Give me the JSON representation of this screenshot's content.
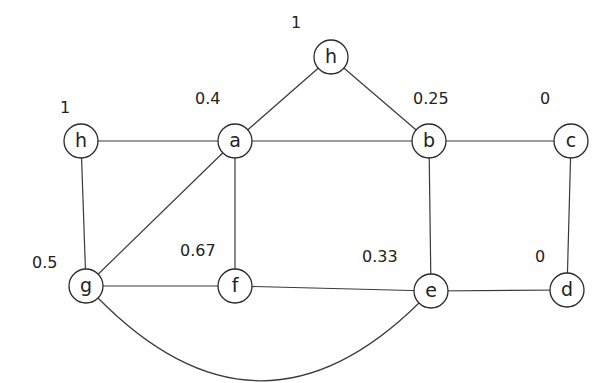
{
  "diagram": {
    "type": "graph",
    "node_radius": 17,
    "colors": {
      "stroke": "#2a2a2a",
      "background": "#ffffff",
      "text": "#222222"
    },
    "nodes": [
      {
        "id": "h_top",
        "label": "h",
        "value": "1",
        "x": 331,
        "y": 57,
        "vx": 291,
        "vy": 28
      },
      {
        "id": "h_left",
        "label": "h",
        "value": "1",
        "x": 81,
        "y": 141,
        "vx": 60,
        "vy": 113
      },
      {
        "id": "a",
        "label": "a",
        "value": "0.4",
        "x": 235,
        "y": 141,
        "vx": 195,
        "vy": 104
      },
      {
        "id": "b",
        "label": "b",
        "value": "0.25",
        "x": 429,
        "y": 141,
        "vx": 413,
        "vy": 104
      },
      {
        "id": "c",
        "label": "c",
        "value": "0",
        "x": 571,
        "y": 141,
        "vx": 540,
        "vy": 104
      },
      {
        "id": "g",
        "label": "g",
        "value": "0.5",
        "x": 86,
        "y": 286,
        "vx": 32,
        "vy": 268
      },
      {
        "id": "f",
        "label": "f",
        "value": "0.67",
        "x": 235,
        "y": 286,
        "vx": 180,
        "vy": 256
      },
      {
        "id": "e",
        "label": "e",
        "value": "0.33",
        "x": 431,
        "y": 291,
        "vx": 362,
        "vy": 262
      },
      {
        "id": "d",
        "label": "d",
        "value": "0",
        "x": 567,
        "y": 290,
        "vx": 535,
        "vy": 262
      }
    ],
    "edges": [
      {
        "from": "h_top",
        "to": "a"
      },
      {
        "from": "h_top",
        "to": "b"
      },
      {
        "from": "h_left",
        "to": "a"
      },
      {
        "from": "h_left",
        "to": "g"
      },
      {
        "from": "a",
        "to": "b"
      },
      {
        "from": "a",
        "to": "g"
      },
      {
        "from": "a",
        "to": "f"
      },
      {
        "from": "b",
        "to": "c"
      },
      {
        "from": "b",
        "to": "e"
      },
      {
        "from": "c",
        "to": "d"
      },
      {
        "from": "g",
        "to": "f"
      },
      {
        "from": "f",
        "to": "e"
      },
      {
        "from": "e",
        "to": "d"
      },
      {
        "from": "g",
        "to": "e",
        "curved": true
      }
    ]
  }
}
